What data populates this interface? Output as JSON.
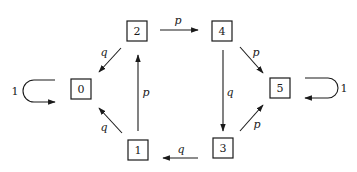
{
  "diagram": {
    "type": "state-transition-graph",
    "nodes": [
      {
        "id": "0",
        "label": "0",
        "x": 81,
        "y": 89
      },
      {
        "id": "1",
        "label": "1",
        "x": 138,
        "y": 150
      },
      {
        "id": "2",
        "label": "2",
        "x": 137,
        "y": 31
      },
      {
        "id": "3",
        "label": "3",
        "x": 223,
        "y": 148
      },
      {
        "id": "4",
        "label": "4",
        "x": 222,
        "y": 31
      },
      {
        "id": "5",
        "label": "5",
        "x": 280,
        "y": 88
      }
    ],
    "edges": [
      {
        "from": "2",
        "to": "4",
        "label": "p"
      },
      {
        "from": "2",
        "to": "0",
        "label": "q"
      },
      {
        "from": "1",
        "to": "2",
        "label": "p"
      },
      {
        "from": "1",
        "to": "0",
        "label": "q"
      },
      {
        "from": "3",
        "to": "1",
        "label": "q"
      },
      {
        "from": "4",
        "to": "3",
        "label": "q"
      },
      {
        "from": "4",
        "to": "5",
        "label": "p"
      },
      {
        "from": "3",
        "to": "5",
        "label": "p"
      },
      {
        "from": "0",
        "to": "0",
        "label": "1"
      },
      {
        "from": "5",
        "to": "5",
        "label": "1"
      }
    ],
    "colors": {
      "stroke": "#1a1a1a",
      "background": "#ffffff"
    }
  }
}
